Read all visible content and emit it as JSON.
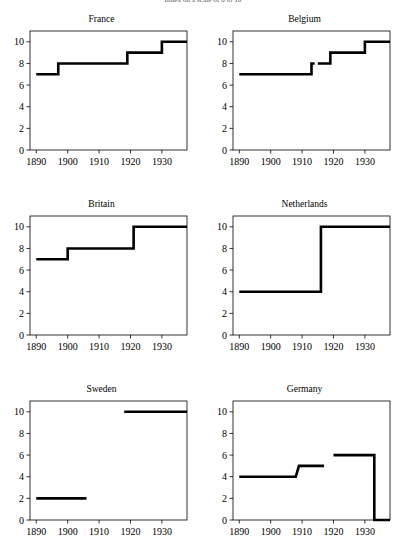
{
  "figure": {
    "overall_title": "Index on a scale of 0 to 10",
    "panel_titles": {
      "france": "France",
      "belgium": "Belgium",
      "britain": "Britain",
      "netherlands": "Netherlands",
      "sweden": "Sweden",
      "germany": "Germany"
    },
    "axis": {
      "x_ticks": [
        "1890",
        "1900",
        "1910",
        "1920",
        "1930"
      ],
      "y_ticks": [
        "0",
        "2",
        "4",
        "6",
        "8",
        "10"
      ]
    },
    "line_color": "#000000"
  },
  "chart_data": [
    {
      "type": "line",
      "title": "France",
      "xlabel": "",
      "ylabel": "",
      "xlim": [
        1888,
        1938
      ],
      "ylim": [
        0,
        11
      ],
      "xticks": [
        1890,
        1900,
        1910,
        1920,
        1930
      ],
      "yticks": [
        0,
        2,
        4,
        6,
        8,
        10
      ],
      "grid": false,
      "legend": "none",
      "step": "post",
      "series": [
        {
          "name": "France",
          "x": [
            1890,
            1897,
            1897,
            1919,
            1919,
            1930,
            1930,
            1938
          ],
          "values": [
            7,
            7,
            8,
            8,
            9,
            9,
            10,
            10
          ]
        }
      ]
    },
    {
      "type": "line",
      "title": "Belgium",
      "xlabel": "",
      "ylabel": "",
      "xlim": [
        1888,
        1938
      ],
      "ylim": [
        0,
        11
      ],
      "xticks": [
        1890,
        1900,
        1910,
        1920,
        1930
      ],
      "yticks": [
        0,
        2,
        4,
        6,
        8,
        10
      ],
      "grid": false,
      "legend": "none",
      "step": "post",
      "segments": [
        {
          "x": [
            1890,
            1913,
            1913,
            1914
          ],
          "values": [
            7,
            7,
            8,
            8
          ]
        },
        {
          "x": [
            1915,
            1919,
            1919,
            1930,
            1930,
            1938
          ],
          "values": [
            8,
            8,
            9,
            9,
            10,
            10
          ]
        }
      ]
    },
    {
      "type": "line",
      "title": "Britain",
      "xlabel": "",
      "ylabel": "",
      "xlim": [
        1888,
        1938
      ],
      "ylim": [
        0,
        11
      ],
      "xticks": [
        1890,
        1900,
        1910,
        1920,
        1930
      ],
      "yticks": [
        0,
        2,
        4,
        6,
        8,
        10
      ],
      "grid": false,
      "legend": "none",
      "step": "post",
      "series": [
        {
          "name": "Britain",
          "x": [
            1890,
            1900,
            1900,
            1921,
            1921,
            1938
          ],
          "values": [
            7,
            7,
            8,
            8,
            10,
            10
          ]
        }
      ]
    },
    {
      "type": "line",
      "title": "Netherlands",
      "xlabel": "",
      "ylabel": "",
      "xlim": [
        1888,
        1938
      ],
      "ylim": [
        0,
        11
      ],
      "xticks": [
        1890,
        1900,
        1910,
        1920,
        1930
      ],
      "yticks": [
        0,
        2,
        4,
        6,
        8,
        10
      ],
      "grid": false,
      "legend": "none",
      "step": "post",
      "series": [
        {
          "name": "Netherlands",
          "x": [
            1890,
            1916,
            1916,
            1938
          ],
          "values": [
            4,
            4,
            10,
            10
          ]
        }
      ]
    },
    {
      "type": "line",
      "title": "Sweden",
      "xlabel": "",
      "ylabel": "",
      "xlim": [
        1888,
        1938
      ],
      "ylim": [
        0,
        11
      ],
      "xticks": [
        1890,
        1900,
        1910,
        1920,
        1930
      ],
      "yticks": [
        0,
        2,
        4,
        6,
        8,
        10
      ],
      "grid": false,
      "legend": "none",
      "step": "post",
      "segments": [
        {
          "x": [
            1890,
            1906
          ],
          "values": [
            2,
            2
          ]
        },
        {
          "x": [
            1918,
            1938
          ],
          "values": [
            10,
            10
          ]
        }
      ]
    },
    {
      "type": "line",
      "title": "Germany",
      "xlabel": "",
      "ylabel": "",
      "xlim": [
        1888,
        1938
      ],
      "ylim": [
        0,
        11
      ],
      "xticks": [
        1890,
        1900,
        1910,
        1920,
        1930
      ],
      "yticks": [
        0,
        2,
        4,
        6,
        8,
        10
      ],
      "grid": false,
      "legend": "none",
      "step": "post",
      "segments": [
        {
          "x": [
            1890,
            1908,
            1909,
            1917
          ],
          "values": [
            4,
            4,
            5,
            5
          ]
        },
        {
          "x": [
            1920,
            1933,
            1933,
            1938
          ],
          "values": [
            6,
            6,
            0,
            0
          ]
        }
      ]
    }
  ]
}
